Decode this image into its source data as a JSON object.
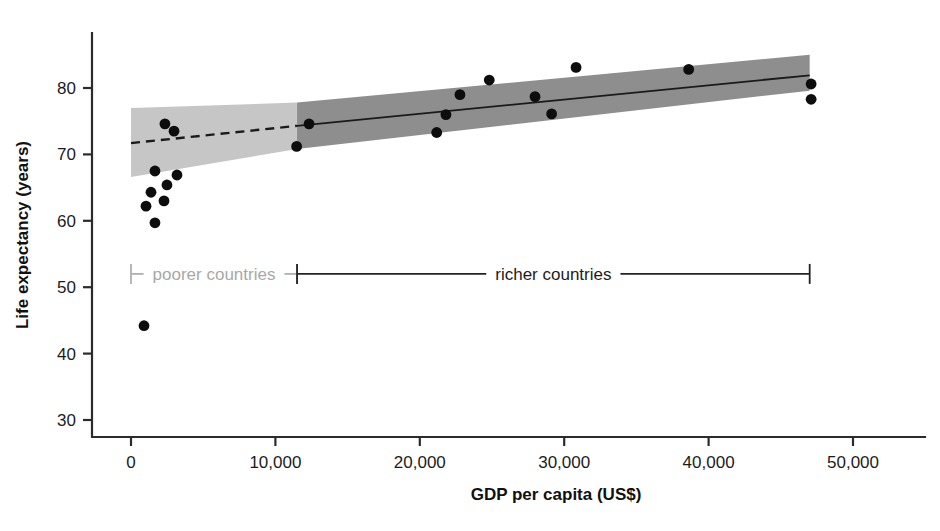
{
  "chart_data": {
    "type": "scatter",
    "title": "",
    "xlabel": "GDP per capita (US$)",
    "ylabel": "Life expectancy (years)",
    "xlim": [
      -2500,
      55000
    ],
    "ylim": [
      27,
      86
    ],
    "xticks": [
      0,
      10000,
      20000,
      30000,
      40000,
      50000
    ],
    "xticklabels": [
      "0",
      "10,000",
      "20,000",
      "30,000",
      "40,000",
      "50,000"
    ],
    "yticks": [
      30,
      40,
      50,
      60,
      70,
      80
    ],
    "yticklabels": [
      "30",
      "40",
      "50",
      "60",
      "70",
      "80"
    ],
    "grid": false,
    "legend": null,
    "points": [
      {
        "x": 900,
        "y": 44.2
      },
      {
        "x": 1040,
        "y": 62.2
      },
      {
        "x": 1385,
        "y": 64.3
      },
      {
        "x": 1660,
        "y": 59.7
      },
      {
        "x": 1660,
        "y": 67.5
      },
      {
        "x": 2285,
        "y": 63.0
      },
      {
        "x": 2350,
        "y": 74.6
      },
      {
        "x": 2490,
        "y": 65.4
      },
      {
        "x": 2980,
        "y": 73.5
      },
      {
        "x": 3185,
        "y": 66.9
      },
      {
        "x": 11470,
        "y": 71.2
      },
      {
        "x": 12330,
        "y": 74.6
      },
      {
        "x": 21170,
        "y": 73.3
      },
      {
        "x": 21810,
        "y": 76.0
      },
      {
        "x": 22780,
        "y": 79.0
      },
      {
        "x": 24810,
        "y": 81.2
      },
      {
        "x": 27980,
        "y": 78.7
      },
      {
        "x": 29130,
        "y": 76.1
      },
      {
        "x": 30820,
        "y": 83.1
      },
      {
        "x": 38620,
        "y": 82.8
      },
      {
        "x": 47100,
        "y": 80.6
      },
      {
        "x": 47100,
        "y": 78.3
      }
    ],
    "series": [
      {
        "name": "poorer-countries-fit",
        "style": "dashed",
        "x": [
          0,
          11500
        ],
        "y": [
          71.7,
          74.3
        ],
        "band_upper": [
          77.0,
          77.8
        ],
        "band_lower": [
          66.6,
          70.8
        ],
        "band_shade": "#c6c6c6"
      },
      {
        "name": "richer-countries-fit",
        "style": "solid",
        "x": [
          11500,
          47000
        ],
        "y": [
          74.3,
          81.9
        ],
        "band_upper": [
          77.8,
          85.0
        ],
        "band_lower": [
          70.8,
          79.6
        ],
        "band_shade": "#8e8e8e"
      }
    ],
    "annotations": [
      {
        "name": "poorer-countries-bracket",
        "label": "poorer countries",
        "x_start": 0,
        "x_end": 11500,
        "y": 52.0,
        "color": "#a8a8a8"
      },
      {
        "name": "richer-countries-bracket",
        "label": "richer countries",
        "x_start": 11500,
        "x_end": 47000,
        "y": 52.0,
        "color": "#1c1c1c"
      }
    ]
  },
  "axes": {
    "y_title": "Life expectancy (years)",
    "x_title": "GDP per capita (US$)",
    "x_tick_labels": [
      "0",
      "10,000",
      "20,000",
      "30,000",
      "40,000",
      "50,000"
    ],
    "y_tick_labels": [
      "80",
      "70",
      "60",
      "50",
      "40",
      "30"
    ]
  },
  "brackets": {
    "poorer": "poorer countries",
    "richer": "richer countries"
  },
  "colors": {
    "band_light": "#c6c6c6",
    "band_dark": "#8e8e8e",
    "point": "#0d0d0d",
    "axis": "#2b2b2b",
    "grey_label": "#a8a8a8"
  }
}
